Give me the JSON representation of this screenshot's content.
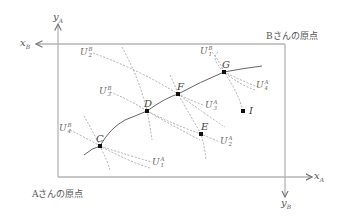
{
  "diagram": {
    "type": "edgeworth-box",
    "origins": {
      "A": "Aさんの原点",
      "B": "Bさんの原点"
    },
    "axes": {
      "xA": {
        "var": "x",
        "sub": "A"
      },
      "yA": {
        "var": "y",
        "sub": "A"
      },
      "xB": {
        "var": "x",
        "sub": "B"
      },
      "yB": {
        "var": "y",
        "sub": "B"
      }
    },
    "points": [
      {
        "name": "C",
        "x": 100,
        "y": 146
      },
      {
        "name": "D",
        "x": 147,
        "y": 111
      },
      {
        "name": "F",
        "x": 178,
        "y": 94
      },
      {
        "name": "G",
        "x": 224,
        "y": 72
      },
      {
        "name": "E",
        "x": 201,
        "y": 134
      },
      {
        "name": "I",
        "x": 243,
        "y": 111
      }
    ],
    "indifference_labels": {
      "UB2": {
        "base": "U",
        "sup": "B",
        "sub": "2"
      },
      "UB1": {
        "base": "U",
        "sup": "B",
        "sub": "1"
      },
      "UB3": {
        "base": "U",
        "sup": "B",
        "sub": "3"
      },
      "UB4": {
        "base": "U",
        "sup": "B",
        "sub": "4"
      },
      "UA4": {
        "base": "U",
        "sup": "A",
        "sub": "4"
      },
      "UA3": {
        "base": "U",
        "sup": "A",
        "sub": "3"
      },
      "UA2": {
        "base": "U",
        "sup": "A",
        "sub": "2"
      },
      "UA1": {
        "base": "U",
        "sup": "A",
        "sub": "1"
      }
    },
    "colors": {
      "box": "#b0b0b0",
      "curve": "#555555",
      "dashed": "#999999",
      "point": "#111111"
    }
  }
}
